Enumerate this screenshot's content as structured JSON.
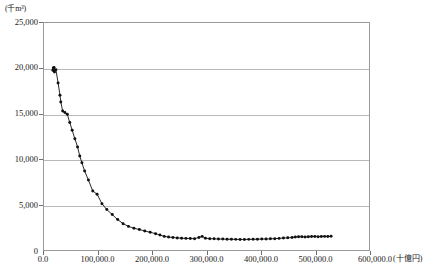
{
  "chart_data": {
    "type": "scatter",
    "title": "",
    "xlabel": "(十億円)",
    "ylabel": "(千m³)",
    "xlim": [
      0.0,
      600000.0
    ],
    "ylim": [
      0,
      25000
    ],
    "grid": "horizontal",
    "legend": "none",
    "marker": "filled-circle",
    "line": "connected",
    "series_color": "#101010",
    "grid_color": "#b9b9b9",
    "frame_color": "#9a9a9a",
    "xticks": [
      "0.0",
      "100,000.0",
      "200,000.0",
      "300,000.0",
      "400,000.0",
      "500,000.0",
      "600,000.0"
    ],
    "xtick_values": [
      0,
      100000,
      200000,
      300000,
      400000,
      500000,
      600000
    ],
    "yticks": [
      "0",
      "5,000",
      "10,000",
      "15,000",
      "20,000",
      "25,000"
    ],
    "ytick_values": [
      0,
      5000,
      10000,
      15000,
      20000,
      25000
    ],
    "x": [
      16500,
      17200,
      18000,
      18600,
      19400,
      22000,
      26000,
      29500,
      31000,
      34500,
      38500,
      43000,
      47500,
      52000,
      57000,
      62000,
      66000,
      70000,
      75000,
      82000,
      90000,
      98000,
      107000,
      116000,
      126000,
      136000,
      146000,
      156000,
      166000,
      176000,
      186000,
      196000,
      206000,
      214000,
      222000,
      230000,
      238000,
      246000,
      254000,
      262000,
      270000,
      278000,
      286000,
      292000,
      298000,
      306000,
      314000,
      322000,
      330000,
      338000,
      346000,
      354000,
      362000,
      370000,
      378000,
      386000,
      394000,
      402000,
      410000,
      418000,
      426000,
      434000,
      442000,
      450000,
      458000,
      464000,
      470000,
      476000,
      482000,
      488000,
      494000,
      500000,
      506000,
      512000,
      518000,
      524000,
      530000
    ],
    "y": [
      19800,
      20050,
      19750,
      20100,
      19600,
      19850,
      18400,
      17050,
      16300,
      15300,
      15150,
      14950,
      14050,
      13200,
      12250,
      11350,
      10350,
      9600,
      8700,
      7700,
      6500,
      6150,
      5100,
      4450,
      3900,
      3350,
      2900,
      2600,
      2400,
      2250,
      2100,
      1950,
      1800,
      1650,
      1500,
      1420,
      1380,
      1330,
      1300,
      1280,
      1260,
      1250,
      1380,
      1500,
      1300,
      1250,
      1230,
      1210,
      1200,
      1190,
      1180,
      1170,
      1160,
      1160,
      1170,
      1180,
      1190,
      1200,
      1210,
      1230,
      1250,
      1280,
      1310,
      1340,
      1380,
      1420,
      1450,
      1470,
      1430,
      1450,
      1480,
      1490,
      1470,
      1480,
      1500,
      1490,
      1510
    ]
  }
}
